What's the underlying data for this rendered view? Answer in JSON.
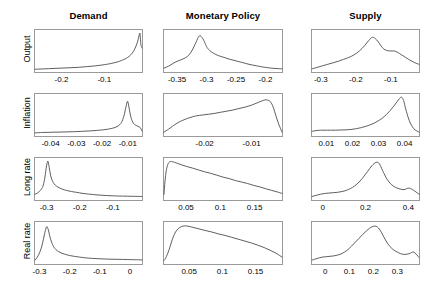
{
  "figure": {
    "column_titles": [
      "Demand",
      "Monetary Policy",
      "Supply"
    ],
    "row_labels": [
      "Output",
      "Inflation",
      "Long rate",
      "Real rate"
    ]
  },
  "chart_data": {
    "type": "line",
    "title": "",
    "layout": {
      "rows": 4,
      "cols": 3,
      "grid": false,
      "legend": "none",
      "ylabel": "density",
      "note": "4x3 grid of kernel density / posterior distribution curves; rows are variables, columns are structural shocks"
    },
    "panels": [
      {
        "row": "Output",
        "col": "Demand",
        "xlim": [
          -0.262,
          -0.012
        ],
        "xticks": [
          -0.2,
          -0.1
        ],
        "xtick_labels": [
          "-0.2",
          "-0.1"
        ],
        "ylim": [
          0,
          1
        ],
        "x": [
          -0.262,
          -0.24,
          -0.22,
          -0.2,
          -0.18,
          -0.16,
          -0.14,
          -0.12,
          -0.1,
          -0.085,
          -0.07,
          -0.06,
          -0.05,
          -0.042,
          -0.035,
          -0.03,
          -0.026,
          -0.022,
          -0.019,
          -0.017,
          -0.0155,
          -0.0145,
          -0.0138,
          -0.0132,
          -0.0126,
          -0.012
        ],
        "y": [
          0.02,
          0.03,
          0.04,
          0.05,
          0.06,
          0.07,
          0.09,
          0.11,
          0.14,
          0.17,
          0.21,
          0.25,
          0.3,
          0.36,
          0.44,
          0.53,
          0.63,
          0.76,
          0.9,
          0.97,
          0.8,
          0.66,
          0.63,
          0.62,
          0.6,
          0.58
        ]
      },
      {
        "row": "Output",
        "col": "Monetary Policy",
        "xlim": [
          -0.372,
          -0.172
        ],
        "xticks": [
          -0.35,
          -0.3,
          -0.25,
          -0.2
        ],
        "xtick_labels": [
          "-0.35",
          "-0.3",
          "-0.25",
          "-0.2"
        ],
        "ylim": [
          0,
          1
        ],
        "x": [
          -0.372,
          -0.362,
          -0.355,
          -0.348,
          -0.34,
          -0.332,
          -0.325,
          -0.318,
          -0.312,
          -0.306,
          -0.3,
          -0.295,
          -0.288,
          -0.28,
          -0.27,
          -0.26,
          -0.25,
          -0.24,
          -0.228,
          -0.215,
          -0.205,
          -0.196,
          -0.19,
          -0.184,
          -0.178,
          -0.172
        ],
        "y": [
          0.05,
          0.12,
          0.19,
          0.24,
          0.29,
          0.36,
          0.5,
          0.72,
          0.9,
          0.82,
          0.62,
          0.52,
          0.44,
          0.38,
          0.33,
          0.28,
          0.24,
          0.2,
          0.15,
          0.11,
          0.08,
          0.06,
          0.05,
          0.04,
          0.035,
          0.03
        ]
      },
      {
        "row": "Output",
        "col": "Supply",
        "xlim": [
          -0.325,
          -0.02
        ],
        "xticks": [
          -0.3,
          -0.2,
          -0.1
        ],
        "xtick_labels": [
          "-0.3",
          "-0.2",
          "-0.1"
        ],
        "ylim": [
          0,
          1
        ],
        "x": [
          -0.325,
          -0.31,
          -0.295,
          -0.28,
          -0.265,
          -0.25,
          -0.235,
          -0.22,
          -0.205,
          -0.19,
          -0.175,
          -0.163,
          -0.153,
          -0.145,
          -0.136,
          -0.128,
          -0.12,
          -0.11,
          -0.1,
          -0.09,
          -0.08,
          -0.07,
          -0.058,
          -0.046,
          -0.034,
          -0.02
        ],
        "y": [
          0.03,
          0.07,
          0.11,
          0.15,
          0.19,
          0.23,
          0.28,
          0.33,
          0.4,
          0.5,
          0.64,
          0.78,
          0.86,
          0.83,
          0.74,
          0.63,
          0.55,
          0.51,
          0.5,
          0.5,
          0.46,
          0.4,
          0.33,
          0.26,
          0.2,
          0.15
        ]
      },
      {
        "row": "Inflation",
        "col": "Demand",
        "xlim": [
          -0.046,
          -0.0045
        ],
        "xticks": [
          -0.04,
          -0.03,
          -0.02,
          -0.01
        ],
        "xtick_labels": [
          "-0.04",
          "-0.03",
          "-0.02",
          "-0.01"
        ],
        "ylim": [
          0,
          1
        ],
        "x": [
          -0.046,
          -0.043,
          -0.04,
          -0.037,
          -0.034,
          -0.031,
          -0.028,
          -0.025,
          -0.022,
          -0.0195,
          -0.0175,
          -0.0155,
          -0.0138,
          -0.0125,
          -0.0115,
          -0.0107,
          -0.0101,
          -0.0096,
          -0.009,
          -0.0084,
          -0.0078,
          -0.0072,
          -0.0066,
          -0.006,
          -0.0052,
          -0.0045
        ],
        "y": [
          0.03,
          0.04,
          0.045,
          0.05,
          0.055,
          0.06,
          0.07,
          0.08,
          0.095,
          0.11,
          0.13,
          0.16,
          0.21,
          0.3,
          0.48,
          0.72,
          0.86,
          0.72,
          0.5,
          0.36,
          0.28,
          0.24,
          0.22,
          0.2,
          0.17,
          0.08
        ]
      },
      {
        "row": "Inflation",
        "col": "Monetary Policy",
        "xlim": [
          -0.0287,
          -0.0035
        ],
        "xticks": [
          -0.02,
          -0.01
        ],
        "xtick_labels": [
          "-0.02",
          "-0.01"
        ],
        "ylim": [
          0,
          1
        ],
        "x": [
          -0.0287,
          -0.0277,
          -0.0267,
          -0.0257,
          -0.0247,
          -0.0237,
          -0.0227,
          -0.0217,
          -0.0205,
          -0.0192,
          -0.018,
          -0.0167,
          -0.0153,
          -0.014,
          -0.0127,
          -0.0113,
          -0.01,
          -0.0088,
          -0.0078,
          -0.007,
          -0.0063,
          -0.0058,
          -0.0053,
          -0.0048,
          -0.0042,
          -0.0035
        ],
        "y": [
          0.05,
          0.13,
          0.22,
          0.3,
          0.36,
          0.41,
          0.45,
          0.48,
          0.5,
          0.52,
          0.54,
          0.57,
          0.6,
          0.63,
          0.67,
          0.71,
          0.76,
          0.82,
          0.87,
          0.9,
          0.88,
          0.82,
          0.68,
          0.48,
          0.26,
          0.05
        ]
      },
      {
        "row": "Inflation",
        "col": "Supply",
        "xlim": [
          0.0045,
          0.0455
        ],
        "xticks": [
          0.01,
          0.02,
          0.03,
          0.04
        ],
        "xtick_labels": [
          "0.01",
          "0.02",
          "0.03",
          "0.04"
        ],
        "ylim": [
          0,
          1
        ],
        "x": [
          0.0045,
          0.006,
          0.0078,
          0.0095,
          0.0115,
          0.0135,
          0.0155,
          0.0175,
          0.0195,
          0.0215,
          0.0235,
          0.0255,
          0.0275,
          0.0295,
          0.0313,
          0.033,
          0.0345,
          0.0358,
          0.037,
          0.038,
          0.0388,
          0.0396,
          0.0404,
          0.0418,
          0.0435,
          0.0455
        ],
        "y": [
          0.07,
          0.09,
          0.1,
          0.1,
          0.1,
          0.1,
          0.105,
          0.11,
          0.12,
          0.14,
          0.17,
          0.21,
          0.26,
          0.33,
          0.41,
          0.51,
          0.62,
          0.73,
          0.84,
          0.93,
          0.97,
          0.88,
          0.66,
          0.35,
          0.14,
          0.05
        ]
      },
      {
        "row": "Long rate",
        "col": "Demand",
        "xlim": [
          -0.335,
          -0.012
        ],
        "xticks": [
          -0.3,
          -0.2,
          -0.1
        ],
        "xtick_labels": [
          "-0.3",
          "-0.2",
          "-0.1"
        ],
        "ylim": [
          0,
          1
        ],
        "x": [
          -0.335,
          -0.328,
          -0.322,
          -0.316,
          -0.31,
          -0.305,
          -0.3,
          -0.296,
          -0.292,
          -0.288,
          -0.283,
          -0.277,
          -0.27,
          -0.262,
          -0.252,
          -0.24,
          -0.225,
          -0.21,
          -0.19,
          -0.17,
          -0.145,
          -0.12,
          -0.095,
          -0.07,
          -0.042,
          -0.012
        ],
        "y": [
          0.1,
          0.13,
          0.17,
          0.23,
          0.34,
          0.55,
          0.85,
          0.97,
          0.8,
          0.6,
          0.46,
          0.37,
          0.31,
          0.27,
          0.23,
          0.2,
          0.17,
          0.15,
          0.12,
          0.1,
          0.08,
          0.065,
          0.055,
          0.05,
          0.045,
          0.04
        ]
      },
      {
        "row": "Long rate",
        "col": "Monetary Policy",
        "xlim": [
          0.018,
          0.19
        ],
        "xticks": [
          0.05,
          0.1,
          0.15
        ],
        "xtick_labels": [
          "0.05",
          "0.1",
          "0.15"
        ],
        "ylim": [
          0,
          1
        ],
        "x": [
          0.018,
          0.0195,
          0.0213,
          0.0235,
          0.026,
          0.029,
          0.033,
          0.038,
          0.044,
          0.051,
          0.059,
          0.068,
          0.077,
          0.086,
          0.095,
          0.104,
          0.113,
          0.122,
          0.131,
          0.14,
          0.149,
          0.158,
          0.167,
          0.175,
          0.183,
          0.19
        ],
        "y": [
          0.1,
          0.45,
          0.72,
          0.88,
          0.95,
          0.96,
          0.94,
          0.91,
          0.87,
          0.83,
          0.79,
          0.74,
          0.69,
          0.65,
          0.6,
          0.55,
          0.51,
          0.46,
          0.42,
          0.38,
          0.33,
          0.29,
          0.24,
          0.2,
          0.16,
          0.12
        ]
      },
      {
        "row": "Long rate",
        "col": "Supply",
        "xlim": [
          -0.05,
          0.45
        ],
        "xticks": [
          0,
          0.2,
          0.4
        ],
        "xtick_labels": [
          "0",
          "0.2",
          "0.4"
        ],
        "ylim": [
          0,
          1
        ],
        "x": [
          -0.05,
          -0.03,
          -0.01,
          0.01,
          0.03,
          0.05,
          0.07,
          0.09,
          0.11,
          0.13,
          0.15,
          0.17,
          0.19,
          0.21,
          0.23,
          0.25,
          0.265,
          0.28,
          0.3,
          0.32,
          0.34,
          0.36,
          0.38,
          0.4,
          0.42,
          0.45
        ],
        "y": [
          0.04,
          0.07,
          0.1,
          0.12,
          0.13,
          0.14,
          0.15,
          0.17,
          0.2,
          0.25,
          0.32,
          0.42,
          0.55,
          0.7,
          0.85,
          0.94,
          0.9,
          0.72,
          0.5,
          0.36,
          0.28,
          0.24,
          0.22,
          0.26,
          0.22,
          0.1
        ]
      },
      {
        "row": "Real rate",
        "col": "Demand",
        "xlim": [
          -0.315,
          0.04
        ],
        "xticks": [
          -0.3,
          -0.2,
          -0.1,
          0
        ],
        "xtick_labels": [
          "-0.3",
          "-0.2",
          "-0.1",
          "0"
        ],
        "ylim": [
          0,
          1
        ],
        "x": [
          -0.315,
          -0.308,
          -0.3,
          -0.293,
          -0.287,
          -0.281,
          -0.276,
          -0.271,
          -0.266,
          -0.26,
          -0.253,
          -0.245,
          -0.236,
          -0.226,
          -0.214,
          -0.2,
          -0.185,
          -0.168,
          -0.148,
          -0.125,
          -0.1,
          -0.07,
          -0.04,
          -0.01,
          0.015,
          0.04
        ],
        "y": [
          0.05,
          0.12,
          0.24,
          0.4,
          0.6,
          0.82,
          0.93,
          0.85,
          0.68,
          0.52,
          0.4,
          0.32,
          0.27,
          0.23,
          0.2,
          0.17,
          0.15,
          0.13,
          0.11,
          0.095,
          0.085,
          0.075,
          0.07,
          0.065,
          0.06,
          0.055
        ]
      },
      {
        "row": "Real rate",
        "col": "Monetary Policy",
        "xlim": [
          0.012,
          0.19
        ],
        "xticks": [
          0.05,
          0.1,
          0.15
        ],
        "xtick_labels": [
          "0.05",
          "0.1",
          "0.15"
        ],
        "ylim": [
          0,
          1
        ],
        "x": [
          0.012,
          0.0145,
          0.017,
          0.0198,
          0.0228,
          0.026,
          0.0295,
          0.0335,
          0.038,
          0.043,
          0.049,
          0.056,
          0.065,
          0.074,
          0.084,
          0.094,
          0.104,
          0.114,
          0.124,
          0.134,
          0.144,
          0.154,
          0.163,
          0.172,
          0.181,
          0.19
        ],
        "y": [
          0.04,
          0.1,
          0.2,
          0.33,
          0.5,
          0.66,
          0.79,
          0.88,
          0.93,
          0.95,
          0.94,
          0.91,
          0.87,
          0.83,
          0.79,
          0.74,
          0.7,
          0.65,
          0.6,
          0.55,
          0.5,
          0.44,
          0.38,
          0.31,
          0.23,
          0.13
        ]
      },
      {
        "row": "Real rate",
        "col": "Supply",
        "xlim": [
          -0.055,
          0.39
        ],
        "xticks": [
          0,
          0.1,
          0.2,
          0.3
        ],
        "xtick_labels": [
          "0",
          "0.1",
          "0.2",
          "0.3"
        ],
        "ylim": [
          0,
          1
        ],
        "x": [
          -0.055,
          -0.04,
          -0.025,
          -0.01,
          0.005,
          0.02,
          0.035,
          0.05,
          0.065,
          0.08,
          0.095,
          0.11,
          0.125,
          0.14,
          0.155,
          0.17,
          0.185,
          0.2,
          0.215,
          0.228,
          0.242,
          0.26,
          0.28,
          0.3,
          0.325,
          0.35,
          0.368,
          0.39
        ],
        "y": [
          0.05,
          0.08,
          0.11,
          0.13,
          0.14,
          0.15,
          0.16,
          0.18,
          0.21,
          0.26,
          0.33,
          0.42,
          0.52,
          0.62,
          0.72,
          0.81,
          0.89,
          0.94,
          0.93,
          0.84,
          0.68,
          0.48,
          0.34,
          0.26,
          0.2,
          0.22,
          0.26,
          0.12
        ]
      }
    ]
  }
}
